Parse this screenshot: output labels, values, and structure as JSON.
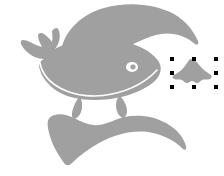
{
  "app": {
    "surface": "vector-drawing-canvas",
    "background_color": "#ffffff",
    "canvas_width": 224,
    "canvas_height": 176
  },
  "palette": {
    "shape_fill": "#a0a0a0",
    "shape_fill_light": "#aaaaaa",
    "highlight_stroke": "#ffffff",
    "selection_handle": "#000000",
    "eye_fill": "#ffffff"
  },
  "objects": [
    {
      "id": "top-arc",
      "name": "top-crescent-shape",
      "role": "decorative-crescent",
      "fill": "#a0a0a0",
      "selected": false
    },
    {
      "id": "whale",
      "name": "whale-silhouette",
      "role": "main-illustration",
      "fill": "#a0a0a0",
      "selected": false,
      "parts": [
        "tail-fluke",
        "body",
        "head",
        "eye",
        "belly-highlight-line",
        "pectoral-fin",
        "ventral-fin"
      ]
    },
    {
      "id": "bottom-arc",
      "name": "bottom-crescent-shape",
      "role": "decorative-crescent",
      "fill": "#a0a0a0",
      "selected": false
    },
    {
      "id": "small-shape",
      "name": "selected-small-shape",
      "role": "selected-object",
      "fill": "#a0a0a0",
      "selected": true
    }
  ],
  "selection": {
    "target": "selected-small-shape",
    "handle_color": "#000000",
    "handle_size": 4,
    "handle_count": 8,
    "bounds": {
      "x": 170,
      "y": 57,
      "width": 44,
      "height": 28
    },
    "handles": [
      {
        "name": "handle-top-left",
        "x": 170,
        "y": 57
      },
      {
        "name": "handle-top-center",
        "x": 192,
        "y": 57
      },
      {
        "name": "handle-top-right",
        "x": 214,
        "y": 57
      },
      {
        "name": "handle-middle-left",
        "x": 170,
        "y": 71
      },
      {
        "name": "handle-middle-right",
        "x": 214,
        "y": 71
      },
      {
        "name": "handle-bottom-left",
        "x": 170,
        "y": 85
      },
      {
        "name": "handle-bottom-center",
        "x": 192,
        "y": 85
      },
      {
        "name": "handle-bottom-right",
        "x": 214,
        "y": 85
      }
    ]
  }
}
